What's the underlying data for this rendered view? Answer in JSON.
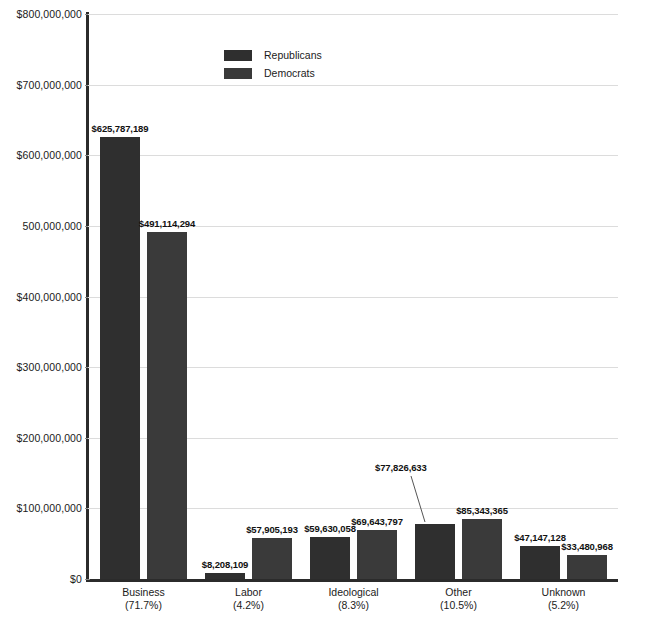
{
  "chart_data": {
    "type": "bar",
    "title": "",
    "xlabel": "",
    "ylabel": "",
    "ylim": [
      0,
      800000000
    ],
    "grid": true,
    "legend_position": "top-center",
    "categories": [
      "Business",
      "Labor",
      "Ideological",
      "Other",
      "Unknown"
    ],
    "category_percents": [
      "(71.7%)",
      "(4.2%)",
      "(8.3%)",
      "(10.5%)",
      "(5.2%)"
    ],
    "series": [
      {
        "name": "Republicans",
        "color": "#2f2f2f",
        "values": [
          625787189,
          8208109,
          59630058,
          77826633,
          47147128
        ],
        "labels": [
          "$625,787,189",
          "$8,208,109",
          "$59,630,058",
          "$77,826,633",
          "$47,147,128"
        ]
      },
      {
        "name": "Democrats",
        "color": "#3a3a3a",
        "values": [
          491114294,
          57905193,
          69643797,
          85343365,
          33480968
        ],
        "labels": [
          "$491,114,294",
          "$57,905,193",
          "$69,643,797",
          "$85,343,365",
          "$33,480,968"
        ]
      }
    ],
    "y_ticks": [
      {
        "value": 800000000,
        "label": "$800,000,000"
      },
      {
        "value": 700000000,
        "label": "$700,000,000"
      },
      {
        "value": 600000000,
        "label": "$600,000,000"
      },
      {
        "value": 500000000,
        "label": "500,000,000"
      },
      {
        "value": 400000000,
        "label": "$400,000,000"
      },
      {
        "value": 300000000,
        "label": "$300,000,000"
      },
      {
        "value": 200000000,
        "label": "$200,000,000"
      },
      {
        "value": 100000000,
        "label": "$100,000,000"
      },
      {
        "value": 0,
        "label": "$0"
      }
    ]
  },
  "legend": {
    "items": [
      {
        "label": "Republicans",
        "color": "#2f2f2f",
        "swatch_name": "legend-swatch-republicans"
      },
      {
        "label": "Democrats",
        "color": "#3a3a3a",
        "swatch_name": "legend-swatch-democrats"
      }
    ]
  },
  "colors": {
    "republican": "#2f2f2f",
    "democrat": "#3a3a3a",
    "axis": "#2b2b2b",
    "gridline": "#dcdcdc",
    "background": "#ffffff",
    "text": "#1b1b1b"
  }
}
